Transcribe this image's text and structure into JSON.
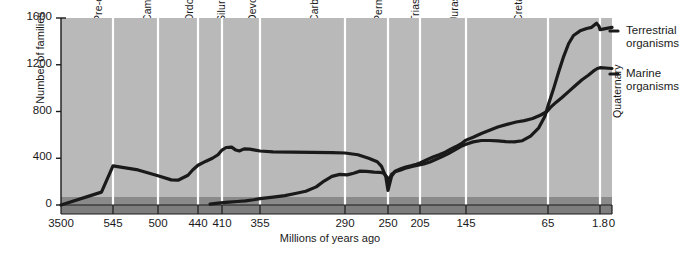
{
  "chart_data": {
    "type": "line",
    "title": "",
    "xlabel": "Millions of years ago",
    "ylabel": "Number of families",
    "ylim": [
      0,
      1600
    ],
    "yticks": [
      0,
      400,
      800,
      1200,
      1600
    ],
    "ytick_labels": [
      "0",
      "400",
      "800",
      "1200",
      "1600"
    ],
    "xtick_labels": [
      "3500",
      "545",
      "500",
      "440",
      "410",
      "355",
      "290",
      "250",
      "205",
      "145",
      "65",
      "1.8",
      "0"
    ],
    "xtick_values": [
      3500,
      545,
      500,
      440,
      410,
      355,
      290,
      250,
      205,
      145,
      65,
      1.8,
      0
    ],
    "grid": false,
    "x_reversed": true,
    "legend_position": "right",
    "plot_background": "#b9b9b9",
    "divider_color": "#ffffff",
    "line_color": "#1a1a1a",
    "baseline_strip_color": "#8a8a8a",
    "periods": [
      {
        "label": "Pre-cambrian",
        "start": 3500,
        "end": 545
      },
      {
        "label": "Cambrian",
        "start": 545,
        "end": 500
      },
      {
        "label": "Ordovician",
        "start": 500,
        "end": 440
      },
      {
        "label": "Silurian",
        "start": 440,
        "end": 410
      },
      {
        "label": "Devonian",
        "start": 410,
        "end": 355
      },
      {
        "label": "Carboniferous",
        "start": 355,
        "end": 290
      },
      {
        "label": "Permian",
        "start": 290,
        "end": 250
      },
      {
        "label": "Triassic",
        "start": 250,
        "end": 205
      },
      {
        "label": "Jurassic",
        "start": 205,
        "end": 145
      },
      {
        "label": "Cretaceous",
        "start": 145,
        "end": 65
      },
      {
        "label": "Tertiary",
        "start": 65,
        "end": 1.8
      },
      {
        "label": "Quaternary",
        "start": 1.8,
        "end": 0
      }
    ],
    "series": [
      {
        "name": "Marine organisms",
        "legend_label_line1": "Marine",
        "legend_label_line2": "organisms",
        "points": [
          [
            3500,
            0
          ],
          [
            1200,
            110
          ],
          [
            545,
            335
          ],
          [
            520,
            300
          ],
          [
            500,
            250
          ],
          [
            480,
            215
          ],
          [
            470,
            212
          ],
          [
            455,
            255
          ],
          [
            448,
            300
          ],
          [
            440,
            340
          ],
          [
            430,
            375
          ],
          [
            422,
            400
          ],
          [
            415,
            430
          ],
          [
            410,
            470
          ],
          [
            404,
            492
          ],
          [
            396,
            495
          ],
          [
            390,
            470
          ],
          [
            385,
            462
          ],
          [
            378,
            480
          ],
          [
            370,
            478
          ],
          [
            362,
            470
          ],
          [
            355,
            462
          ],
          [
            345,
            455
          ],
          [
            330,
            452
          ],
          [
            315,
            450
          ],
          [
            300,
            448
          ],
          [
            290,
            445
          ],
          [
            278,
            430
          ],
          [
            268,
            400
          ],
          [
            260,
            370
          ],
          [
            256,
            330
          ],
          [
            252,
            240
          ],
          [
            250,
            125
          ],
          [
            248,
            175
          ],
          [
            245,
            245
          ],
          [
            240,
            290
          ],
          [
            232,
            310
          ],
          [
            225,
            325
          ],
          [
            218,
            335
          ],
          [
            210,
            348
          ],
          [
            205,
            360
          ],
          [
            196,
            388
          ],
          [
            188,
            410
          ],
          [
            180,
            430
          ],
          [
            172,
            452
          ],
          [
            165,
            478
          ],
          [
            158,
            500
          ],
          [
            150,
            530
          ],
          [
            145,
            555
          ],
          [
            138,
            580
          ],
          [
            130,
            612
          ],
          [
            122,
            640
          ],
          [
            114,
            668
          ],
          [
            105,
            690
          ],
          [
            96,
            710
          ],
          [
            88,
            722
          ],
          [
            80,
            740
          ],
          [
            72,
            770
          ],
          [
            66,
            800
          ],
          [
            62,
            835
          ],
          [
            55,
            880
          ],
          [
            48,
            920
          ],
          [
            40,
            970
          ],
          [
            32,
            1020
          ],
          [
            24,
            1070
          ],
          [
            16,
            1110
          ],
          [
            10,
            1145
          ],
          [
            5,
            1168
          ],
          [
            1.8,
            1175
          ],
          [
            0,
            1168
          ]
        ]
      },
      {
        "name": "Terrestrial organisms",
        "legend_label_line1": "Terrestrial",
        "legend_label_line2": "organisms",
        "points": [
          [
            425,
            8
          ],
          [
            412,
            18
          ],
          [
            400,
            25
          ],
          [
            388,
            30
          ],
          [
            376,
            36
          ],
          [
            364,
            45
          ],
          [
            355,
            55
          ],
          [
            345,
            68
          ],
          [
            336,
            80
          ],
          [
            328,
            98
          ],
          [
            320,
            118
          ],
          [
            312,
            155
          ],
          [
            306,
            205
          ],
          [
            300,
            245
          ],
          [
            294,
            262
          ],
          [
            288,
            258
          ],
          [
            282,
            272
          ],
          [
            276,
            290
          ],
          [
            270,
            288
          ],
          [
            263,
            282
          ],
          [
            258,
            280
          ],
          [
            254,
            272
          ],
          [
            251,
            240
          ],
          [
            250,
            195
          ],
          [
            248,
            225
          ],
          [
            245,
            262
          ],
          [
            240,
            285
          ],
          [
            232,
            300
          ],
          [
            224,
            318
          ],
          [
            216,
            330
          ],
          [
            208,
            340
          ],
          [
            200,
            352
          ],
          [
            192,
            368
          ],
          [
            184,
            392
          ],
          [
            176,
            415
          ],
          [
            168,
            440
          ],
          [
            160,
            470
          ],
          [
            152,
            500
          ],
          [
            145,
            520
          ],
          [
            138,
            540
          ],
          [
            130,
            552
          ],
          [
            122,
            552
          ],
          [
            114,
            548
          ],
          [
            106,
            542
          ],
          [
            98,
            540
          ],
          [
            90,
            550
          ],
          [
            82,
            590
          ],
          [
            74,
            660
          ],
          [
            68,
            760
          ],
          [
            64,
            870
          ],
          [
            58,
            1000
          ],
          [
            52,
            1140
          ],
          [
            46,
            1270
          ],
          [
            40,
            1380
          ],
          [
            34,
            1450
          ],
          [
            26,
            1490
          ],
          [
            18,
            1510
          ],
          [
            12,
            1520
          ],
          [
            6,
            1555
          ],
          [
            3,
            1530
          ],
          [
            1.8,
            1500
          ],
          [
            0,
            1520
          ]
        ]
      }
    ]
  }
}
